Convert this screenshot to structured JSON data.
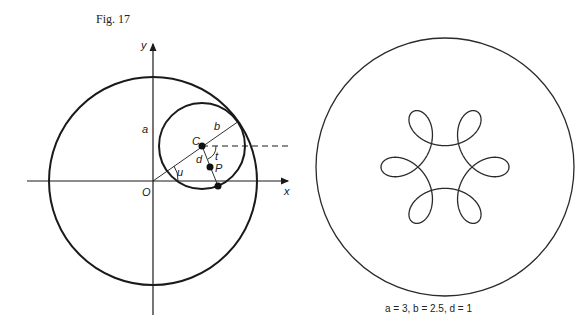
{
  "figure": {
    "title": "Fig. 17"
  },
  "left_diagram": {
    "axis_labels": {
      "x": "x",
      "y": "y",
      "origin": "O"
    },
    "point_labels": {
      "center": "C",
      "point": "P"
    },
    "segment_labels": {
      "a": "a",
      "b": "b",
      "d": "d"
    },
    "angle_labels": {
      "u": "u",
      "t": "t"
    },
    "colors": {
      "stroke": "#1a1a1a",
      "background": "#ffffff"
    }
  },
  "right_diagram": {
    "caption": "a = 3, b = 2.5, d = 1",
    "parameters": {
      "a": 3,
      "b": 2.5,
      "d": 1
    },
    "curve": "hypotrochoid with six loops",
    "colors": {
      "stroke": "#2a2a2a"
    }
  }
}
